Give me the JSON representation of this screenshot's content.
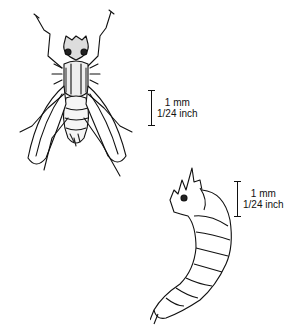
{
  "figures": [
    {
      "subject": "adult fly",
      "scale": {
        "metric": "1 mm",
        "imperial": "1/24 inch"
      }
    },
    {
      "subject": "larva",
      "scale": {
        "metric": "1 mm",
        "imperial": "1/24 inch"
      }
    }
  ]
}
